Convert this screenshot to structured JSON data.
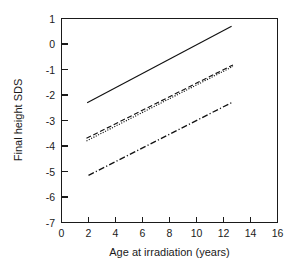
{
  "chart_data": {
    "type": "line",
    "title": "",
    "xlabel": "Age at irradiation (years)",
    "ylabel": "Final height SDS",
    "xlim": [
      0,
      16
    ],
    "ylim": [
      -7,
      1
    ],
    "xticks": [
      0,
      2,
      4,
      6,
      8,
      10,
      12,
      14,
      16
    ],
    "yticks": [
      1,
      0,
      -1,
      -2,
      -3,
      -4,
      -5,
      -6,
      -7
    ],
    "xtick_labels": [
      "0",
      "2",
      "4",
      "6",
      "8",
      "10",
      "12",
      "14",
      "16"
    ],
    "ytick_labels": [
      "1",
      "0",
      "-1",
      "-2",
      "-3",
      "-4",
      "-5",
      "-6",
      "-7"
    ],
    "grid": false,
    "legend": "none",
    "series": [
      {
        "name": "solid",
        "style": "solid",
        "color": "#111111",
        "x": [
          1.9,
          12.6
        ],
        "y": [
          -2.3,
          0.7
        ]
      },
      {
        "name": "dashed",
        "style": "dashed",
        "color": "#111111",
        "x": [
          1.85,
          12.7
        ],
        "y": [
          -3.7,
          -0.82
        ]
      },
      {
        "name": "dotted",
        "style": "dotted",
        "color": "#111111",
        "x": [
          1.85,
          12.7
        ],
        "y": [
          -3.8,
          -0.88
        ]
      },
      {
        "name": "dash-dot",
        "style": "dashdot",
        "color": "#111111",
        "x": [
          2.0,
          12.6
        ],
        "y": [
          -5.15,
          -2.3
        ]
      }
    ]
  }
}
